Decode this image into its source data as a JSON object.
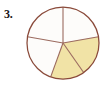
{
  "problem": {
    "number_label": "3.",
    "figure_type": "fraction-circle"
  },
  "colors": {
    "page_background": "#ffffff",
    "outline": "#8a4a3a",
    "divider": "#9b6a5e",
    "shaded_fill": "#f1e3a6",
    "unshaded_fill": "#fdfcfa",
    "label_text": "#1a1517"
  },
  "chart_data": {
    "type": "pie",
    "title": "",
    "subtitle": "",
    "xlabel": "",
    "ylabel": "",
    "legend": [],
    "legend_position": "none",
    "grid": false,
    "total_slices": 5,
    "shaded_slices": 2,
    "fraction_shaded": "2/5",
    "equal_slices": false,
    "center": {
      "x": 63,
      "y": 43
    },
    "radius": 36,
    "categories": [
      "slice-1-top-right",
      "slice-2-top-left",
      "slice-3-left",
      "slice-4-bottom-left",
      "slice-5-bottom-right"
    ],
    "values": [
      80,
      80,
      80,
      55,
      65
    ],
    "slices": [
      {
        "name": "slice-1-top-right",
        "start_angle_deg": 10,
        "end_angle_deg": 90,
        "sweep_deg": 80,
        "shaded": false,
        "fill": "#fdfcfa"
      },
      {
        "name": "slice-2-top-left",
        "start_angle_deg": 90,
        "end_angle_deg": 170,
        "sweep_deg": 80,
        "shaded": false,
        "fill": "#fdfcfa"
      },
      {
        "name": "slice-3-left",
        "start_angle_deg": 170,
        "end_angle_deg": 250,
        "sweep_deg": 80,
        "shaded": false,
        "fill": "#fdfcfa"
      },
      {
        "name": "slice-4-bottom-left",
        "start_angle_deg": 250,
        "end_angle_deg": 305,
        "sweep_deg": 55,
        "shaded": true,
        "fill": "#f1e3a6"
      },
      {
        "name": "slice-5-bottom-right",
        "start_angle_deg": 305,
        "end_angle_deg": 370,
        "sweep_deg": 65,
        "shaded": true,
        "fill": "#f1e3a6"
      }
    ],
    "radii_angles_deg": [
      10,
      90,
      170,
      250,
      305
    ]
  }
}
